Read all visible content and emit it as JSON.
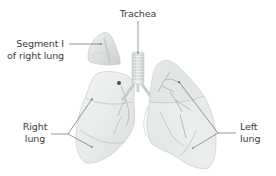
{
  "figure": {
    "labels": {
      "trachea": {
        "text": "Trachea"
      },
      "segment_i": {
        "line1": "Segment I",
        "line2": "of right lung"
      },
      "right_lung": {
        "line1": "Right",
        "line2": "lung"
      },
      "left_lung": {
        "line1": "Left",
        "line2": "lung"
      }
    },
    "structures": [
      {
        "name": "Trachea"
      },
      {
        "name": "Segment I of right lung"
      },
      {
        "name": "Right lung"
      },
      {
        "name": "Left lung"
      }
    ],
    "colors": {
      "background": "#ffffff",
      "lung_fill": "#e9ecec",
      "lung_shade": "#d4d8d8",
      "lung_edge": "#b8bcbc",
      "vessel": "#8a9090",
      "leader_line": "#555555",
      "text": "#3a3a3a"
    }
  }
}
